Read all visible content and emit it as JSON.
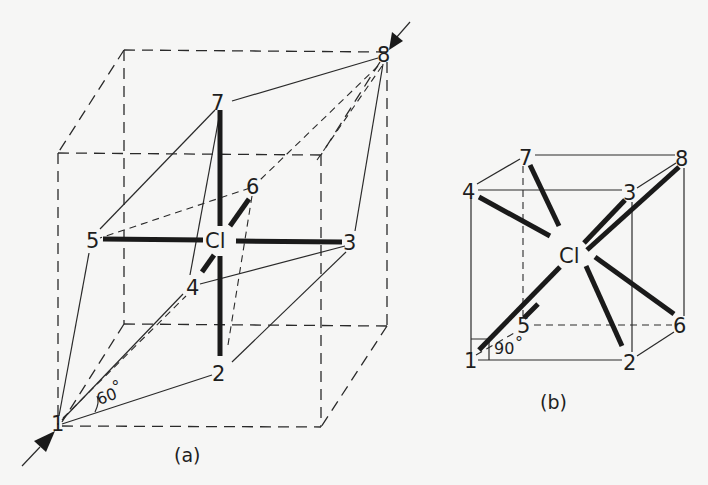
{
  "figure": {
    "panel_a": {
      "caption": "(a)",
      "center_atom": "Cl",
      "vertices": [
        "1",
        "2",
        "3",
        "4",
        "5",
        "6",
        "7",
        "8"
      ],
      "angle_label": "60°",
      "view_axis": "1 → 8 (body diagonal, arrows)"
    },
    "panel_b": {
      "caption": "(b)",
      "center_atom": "Cl",
      "vertices": [
        "1",
        "2",
        "3",
        "4",
        "5",
        "6",
        "7",
        "8"
      ],
      "angle_label": "90°"
    }
  },
  "labels": {
    "a": {
      "v1": "1",
      "v2": "2",
      "v3": "3",
      "v4": "4",
      "v5": "5",
      "v6": "6",
      "v7": "7",
      "v8": "8",
      "center": "Cl",
      "angle": "60",
      "degree": "°",
      "caption": "(a)"
    },
    "b": {
      "v1": "1",
      "v2": "2",
      "v3": "3",
      "v4": "4",
      "v5": "5",
      "v6": "6",
      "v7": "7",
      "v8": "8",
      "center": "Cl",
      "angle": "90",
      "degree": "°",
      "caption": "(b)"
    }
  },
  "colors": {
    "background": "#f6f6f5",
    "ink": "#1e1e1e"
  }
}
